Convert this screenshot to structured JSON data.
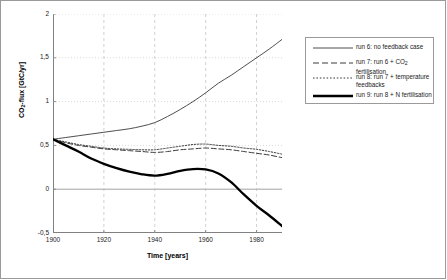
{
  "chart_data": {
    "type": "line",
    "title": "",
    "xlabel": "Time [years]",
    "ylabel_html": "CO<sub>2</sub>-flux [GtC/yr]",
    "ylabel_text": "CO2-flux [GtC/yr]",
    "xlim": [
      1900,
      1990
    ],
    "ylim": [
      -0.5,
      2
    ],
    "xticks": [
      "1900",
      "1920",
      "1940",
      "1960",
      "1980"
    ],
    "xtick_values": [
      1900,
      1920,
      1940,
      1960,
      1980
    ],
    "yticks": [
      "2",
      "1,5",
      "1",
      "0,5",
      "0",
      "-0,5"
    ],
    "ytick_values": [
      2,
      1.5,
      1,
      0.5,
      0,
      -0.5
    ],
    "grid": "dashed vertical gridlines at x ticks; dotted horizontal gridlines at y ticks; solid gray zero line",
    "legend_position": "right-outside",
    "x": [
      1900,
      1905,
      1910,
      1915,
      1920,
      1925,
      1930,
      1935,
      1940,
      1945,
      1950,
      1955,
      1960,
      1965,
      1970,
      1975,
      1980,
      1985,
      1990
    ],
    "series": [
      {
        "name": "run 6: no feedback case",
        "style": "solid-thin",
        "color": "#3a3a3a",
        "values": [
          0.57,
          0.59,
          0.61,
          0.63,
          0.65,
          0.67,
          0.69,
          0.72,
          0.76,
          0.83,
          0.91,
          1.0,
          1.1,
          1.21,
          1.3,
          1.4,
          1.5,
          1.6,
          1.71
        ]
      },
      {
        "name": "run 7: run 6 + CO2 fertilisation",
        "name_html": "run 7: run 6 + CO<sub>2</sub> fertilisation",
        "style": "dashed",
        "color": "#3a3a3a",
        "values": [
          0.57,
          0.53,
          0.5,
          0.48,
          0.46,
          0.45,
          0.44,
          0.43,
          0.42,
          0.43,
          0.45,
          0.46,
          0.47,
          0.46,
          0.45,
          0.43,
          0.41,
          0.39,
          0.36
        ]
      },
      {
        "name": "run 8: run 7 + temperature feedbacks",
        "name_line1": "run 8: run 7 + temperature",
        "name_line2": "feedbacks",
        "style": "dotted",
        "color": "#3a3a3a",
        "values": [
          0.57,
          0.54,
          0.51,
          0.49,
          0.47,
          0.46,
          0.455,
          0.45,
          0.45,
          0.47,
          0.49,
          0.51,
          0.515,
          0.5,
          0.49,
          0.47,
          0.455,
          0.43,
          0.4
        ]
      },
      {
        "name": "run 9: run 8 + N fertilisation",
        "style": "solid-thick",
        "color": "#000000",
        "values": [
          0.57,
          0.5,
          0.43,
          0.35,
          0.29,
          0.24,
          0.2,
          0.17,
          0.155,
          0.175,
          0.21,
          0.23,
          0.225,
          0.18,
          0.08,
          -0.06,
          -0.19,
          -0.3,
          -0.42
        ]
      }
    ]
  },
  "legend": {
    "items": [
      {
        "label": "run 6: no feedback case"
      },
      {
        "label_pre": "run 7: run 6 + CO",
        "label_sub": "2",
        "label_post": " fertilisation"
      },
      {
        "label_l1": "run 8: run 7 + temperature",
        "label_l2": "feedbacks"
      },
      {
        "label": "run 9: run 8 + N fertilisation"
      }
    ]
  },
  "axis": {
    "x_title": "Time [years]",
    "y_title_pre": "CO",
    "y_title_sub": "2",
    "y_title_post": "-flux [GtC/yr]"
  }
}
